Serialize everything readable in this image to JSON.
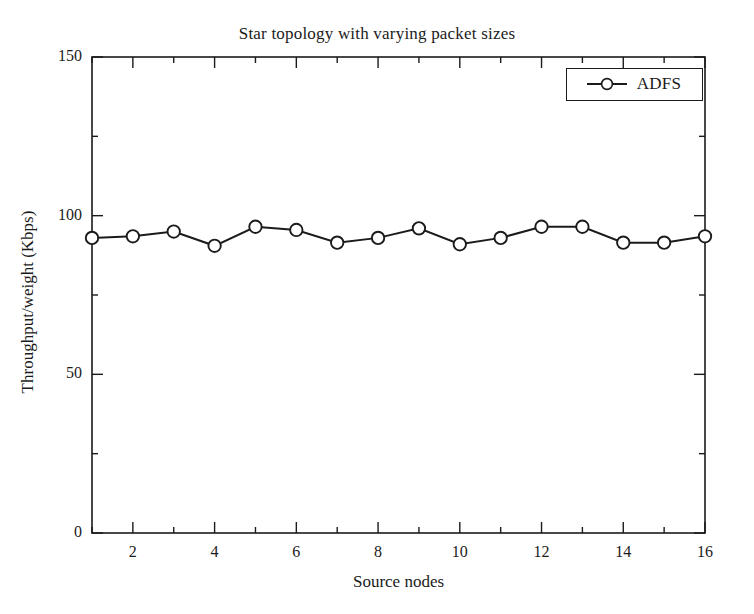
{
  "chart_data": {
    "type": "line",
    "title": "Star topology with varying packet sizes",
    "xlabel": "Source nodes",
    "ylabel": "Throughput/weight (Kbps)",
    "xlim": [
      1,
      16
    ],
    "ylim": [
      0,
      150
    ],
    "x": [
      1,
      2,
      3,
      4,
      5,
      6,
      7,
      8,
      9,
      10,
      11,
      12,
      13,
      14,
      15,
      16
    ],
    "series": [
      {
        "name": "ADFS",
        "marker": "circle-open",
        "color": "#1b1b1b",
        "values": [
          93,
          93.5,
          95,
          90.5,
          96.5,
          95.5,
          91.5,
          93,
          96,
          91,
          93,
          96.5,
          96.5,
          91.5,
          91.5,
          93.5
        ]
      }
    ],
    "y_ticks_major": [
      0,
      50,
      100,
      150
    ],
    "x_ticks_major": [
      2,
      4,
      6,
      8,
      10,
      12,
      14,
      16
    ],
    "x_ticks_minor": [
      1,
      3,
      5,
      7,
      9,
      11,
      13,
      15
    ],
    "y_ticks_minor": [
      25,
      75,
      125
    ],
    "grid": false,
    "legend_position": "top-right",
    "legend_entries": [
      "ADFS"
    ]
  },
  "axes": {
    "y_tick_labels": [
      "150",
      "100",
      "50",
      "0"
    ],
    "x_tick_labels": [
      "2",
      "4",
      "6",
      "8",
      "10",
      "12",
      "14",
      "16"
    ]
  },
  "legend": {
    "label": "ADFS"
  }
}
